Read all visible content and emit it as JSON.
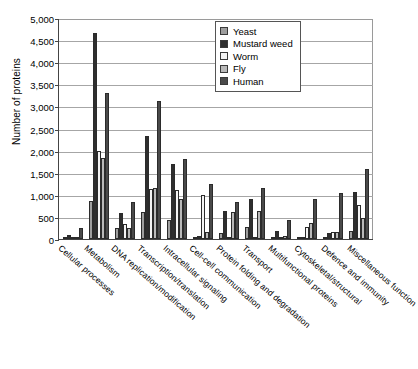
{
  "chart_data": {
    "type": "bar",
    "title": "",
    "xlabel": "",
    "ylabel": "Number of proteins",
    "ylim": [
      0,
      5000
    ],
    "ytick_step": 500,
    "ytick_labels": [
      "5,000",
      "4,500",
      "4,000",
      "3,500",
      "3,000",
      "2,500",
      "2,000",
      "1,500",
      "1,000",
      "500",
      "0"
    ],
    "grid": true,
    "legend_position": "top-right",
    "categories": [
      "Cellular processes",
      "Metabolism",
      "DNA replication/modification",
      "Transcription/translation",
      "Intracellular signaling",
      "Cell-cell communication",
      "Protein folding and degradation",
      "Transport",
      "Multifunctional proteins",
      "Cytoskeletal/structural",
      "Defence and immunity",
      "Miscellaneous function"
    ],
    "series": [
      {
        "name": "Yeast",
        "color": "#9e9e9e",
        "values": [
          30,
          850,
          240,
          600,
          420,
          30,
          130,
          270,
          40,
          30,
          30,
          190
        ]
      },
      {
        "name": "Mustard weed",
        "color": "#2e2e2e",
        "values": [
          100,
          4650,
          590,
          2320,
          1690,
          60,
          640,
          900,
          190,
          30,
          130,
          1060
        ]
      },
      {
        "name": "Worm",
        "color": "#f4f4f4",
        "values": [
          20,
          1980,
          330,
          1140,
          1110,
          990,
          0,
          0,
          40,
          280,
          150,
          760
        ]
      },
      {
        "name": "Fly",
        "color": "#b9b9b9",
        "values": [
          30,
          1830,
          260,
          1150,
          900,
          170,
          610,
          640,
          60,
          370,
          170,
          480
        ]
      },
      {
        "name": "Human",
        "color": "#4a4a4a",
        "values": [
          240,
          3300,
          840,
          3120,
          1800,
          1240,
          830,
          1150,
          420,
          900,
          1040,
          1590
        ]
      }
    ]
  },
  "legend": {
    "items": [
      {
        "label": "Yeast"
      },
      {
        "label": "Mustard weed"
      },
      {
        "label": "Worm"
      },
      {
        "label": "Fly"
      },
      {
        "label": "Human"
      }
    ]
  }
}
